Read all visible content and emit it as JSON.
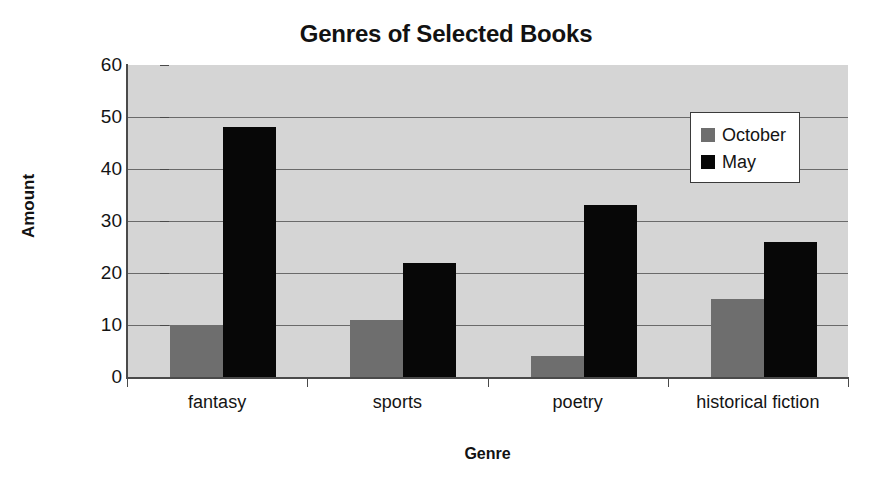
{
  "chart_data": {
    "type": "bar",
    "title": "Genres of Selected Books",
    "xlabel": "Genre",
    "ylabel": "Amount",
    "categories": [
      "fantasy",
      "sports",
      "poetry",
      "historical fiction"
    ],
    "series": [
      {
        "name": "October",
        "color": "#6e6e6e",
        "values": [
          10,
          11,
          4,
          15
        ]
      },
      {
        "name": "May",
        "color": "#070707",
        "values": [
          48,
          22,
          33,
          26
        ]
      }
    ],
    "ylim": [
      0,
      60
    ],
    "ytick_step": 10,
    "yticks": [
      "0",
      "10",
      "20",
      "30",
      "40",
      "50",
      "60"
    ],
    "grid": true,
    "grid_axis": "y",
    "legend_position": "top-right-inside",
    "plot_background": "#d5d5d5",
    "page_background": "#ffffff"
  }
}
